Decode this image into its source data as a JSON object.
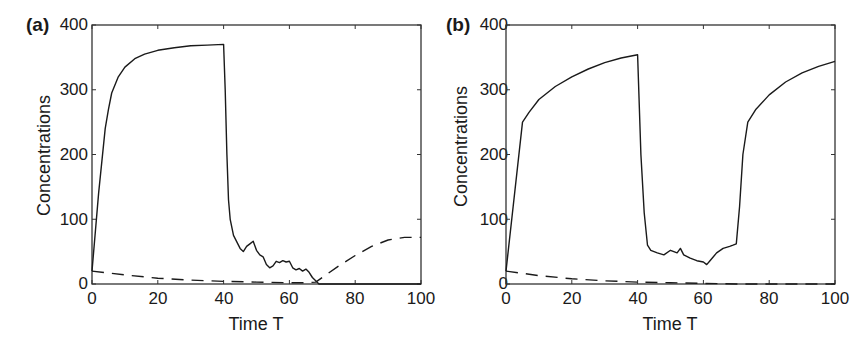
{
  "chart_data": [
    {
      "type": "line",
      "panel_label": "(a)",
      "title": "",
      "xlabel": "Time T",
      "ylabel": "Concentrations",
      "xlim": [
        0,
        100
      ],
      "ylim": [
        0,
        400
      ],
      "xticks": [
        "0",
        "20",
        "40",
        "60",
        "80",
        "100"
      ],
      "yticks": [
        "0",
        "100",
        "200",
        "300",
        "400"
      ],
      "grid": false,
      "legend": "none",
      "series": [
        {
          "name": "solid",
          "style": "solid",
          "x": [
            0,
            2,
            4,
            5,
            6,
            8,
            10,
            13,
            16,
            20,
            25,
            30,
            35,
            40,
            40.5,
            41,
            41.5,
            42,
            43,
            44,
            45,
            46,
            47,
            48,
            49,
            50,
            51,
            52,
            53,
            54,
            55,
            56,
            57,
            58,
            59,
            60,
            61,
            62,
            63,
            64,
            65,
            66,
            67,
            68,
            69,
            70,
            80,
            90,
            100
          ],
          "values": [
            20,
            140,
            240,
            270,
            295,
            320,
            335,
            348,
            355,
            361,
            365,
            368,
            369,
            370,
            300,
            200,
            130,
            100,
            75,
            65,
            55,
            50,
            58,
            62,
            66,
            52,
            45,
            42,
            30,
            25,
            28,
            35,
            33,
            36,
            34,
            35,
            25,
            22,
            24,
            20,
            23,
            18,
            10,
            5,
            0,
            0,
            0,
            0,
            0
          ]
        },
        {
          "name": "dashed",
          "style": "dashed",
          "x": [
            0,
            10,
            20,
            30,
            40,
            50,
            60,
            65,
            68,
            70,
            75,
            80,
            85,
            90,
            95,
            100
          ],
          "values": [
            20,
            14,
            9,
            6,
            4,
            3,
            2,
            2,
            3,
            10,
            28,
            44,
            58,
            68,
            72,
            72
          ]
        }
      ]
    },
    {
      "type": "line",
      "panel_label": "(b)",
      "title": "",
      "xlabel": "Time T",
      "ylabel": "Concentrations",
      "xlim": [
        0,
        100
      ],
      "ylim": [
        0,
        400
      ],
      "xticks": [
        "0",
        "20",
        "40",
        "60",
        "80",
        "100"
      ],
      "yticks": [
        "0",
        "100",
        "200",
        "300",
        "400"
      ],
      "grid": false,
      "legend": "none",
      "series": [
        {
          "name": "solid",
          "style": "solid",
          "x": [
            0,
            5,
            7,
            10,
            15,
            20,
            25,
            30,
            35,
            40,
            41,
            42,
            43,
            44,
            46,
            48,
            50,
            52,
            53,
            54,
            56,
            58,
            60,
            61,
            62,
            64,
            66,
            68,
            69,
            70,
            71,
            72,
            73.5,
            76,
            80,
            85,
            90,
            95,
            100
          ],
          "values": [
            20,
            250,
            265,
            285,
            305,
            320,
            332,
            342,
            349,
            354,
            200,
            110,
            60,
            52,
            48,
            45,
            52,
            48,
            55,
            45,
            40,
            36,
            34,
            30,
            36,
            48,
            55,
            58,
            60,
            62,
            120,
            200,
            250,
            270,
            292,
            312,
            326,
            336,
            344
          ]
        },
        {
          "name": "dashed",
          "style": "dashed",
          "x": [
            0,
            10,
            20,
            30,
            40,
            50,
            60,
            70,
            80,
            90,
            100
          ],
          "values": [
            20,
            13,
            8,
            5,
            3,
            2,
            1,
            0,
            0,
            0,
            0
          ]
        }
      ]
    }
  ],
  "panels": [
    {
      "label": "(a)",
      "xlabel": "Time T",
      "ylabel": "Concentrations"
    },
    {
      "label": "(b)",
      "xlabel": "Time T",
      "ylabel": "Concentrations"
    }
  ],
  "colors": {
    "line": "#1a1a1a",
    "axis": "#333333",
    "background": "#ffffff"
  }
}
